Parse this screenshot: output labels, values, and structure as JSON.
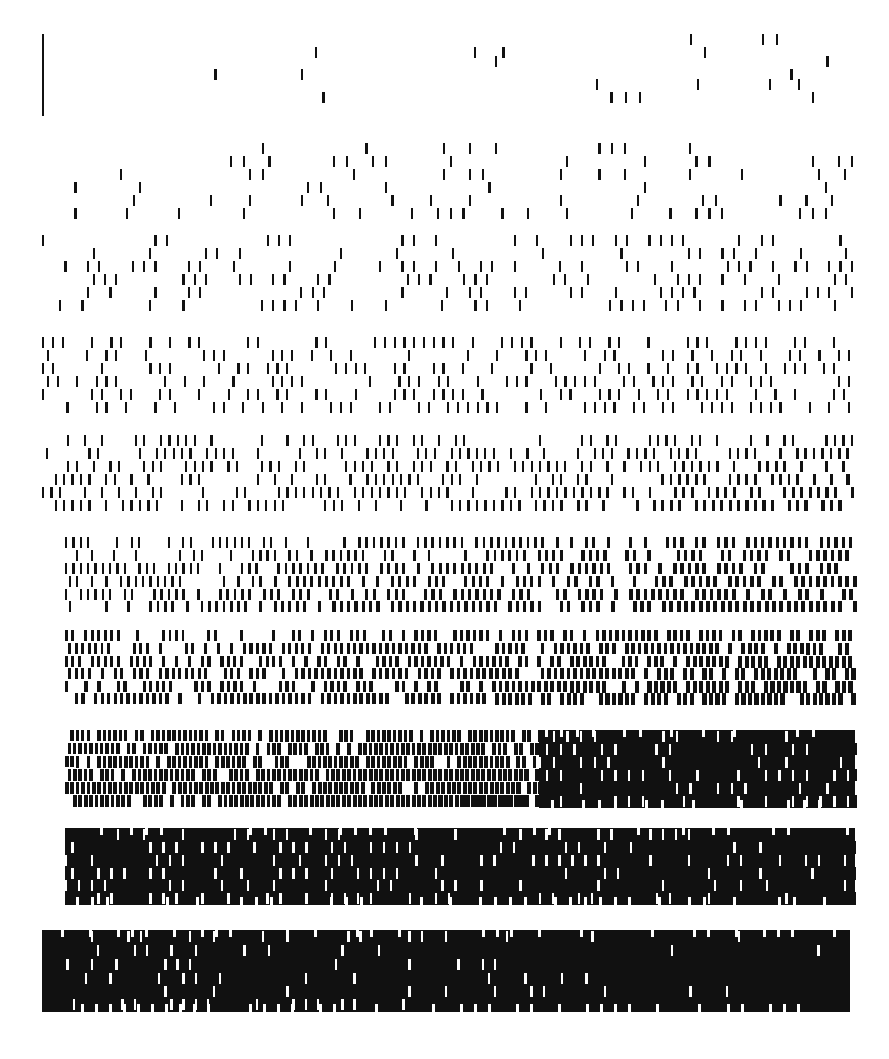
{
  "figure": {
    "type": "raster-pattern",
    "background_color": "#ffffff",
    "ink_color": "#111111",
    "canvas": {
      "width": 889,
      "height": 1059
    },
    "band_count": 10,
    "rows_per_band": 6,
    "dash_width_px": 2.2,
    "dash_height_px": 11,
    "row_pitch_px": 13,
    "marker": {
      "name": "left-rule",
      "x": 42,
      "y_top": 34,
      "y_bottom": 116,
      "width": 2.4,
      "color": "#111111"
    },
    "bands": [
      {
        "index": 1,
        "label": "band-1",
        "y_top": 34,
        "y_bottom": 122,
        "x_start": 200,
        "x_end": 860,
        "density_start": 0.02,
        "density_end": 0.16,
        "rows": 6,
        "row_offsets": [
          0,
          22,
          13,
          45,
          35,
          58
        ],
        "has_rule": true
      },
      {
        "index": 2,
        "label": "band-2",
        "y_top": 143,
        "y_bottom": 222,
        "x_start": 42,
        "x_end": 858,
        "density_start": 0.12,
        "density_end": 0.3,
        "rows": 6,
        "row_offsets": [
          0,
          13,
          26,
          39,
          52,
          65
        ],
        "has_rule": false
      },
      {
        "index": 3,
        "label": "band-3",
        "y_top": 235,
        "y_bottom": 313,
        "x_start": 42,
        "x_end": 858,
        "density_start": 0.26,
        "density_end": 0.44,
        "rows": 6,
        "row_offsets": [
          0,
          13,
          26,
          39,
          52,
          65
        ],
        "has_rule": false
      },
      {
        "index": 4,
        "label": "band-4",
        "y_top": 337,
        "y_bottom": 415,
        "x_start": 42,
        "x_end": 855,
        "density_start": 0.38,
        "density_end": 0.56,
        "rows": 6,
        "row_offsets": [
          0,
          13,
          26,
          39,
          52,
          65
        ],
        "has_rule": false
      },
      {
        "index": 5,
        "label": "band-5",
        "y_top": 435,
        "y_bottom": 513,
        "x_start": 42,
        "x_end": 855,
        "density_start": 0.5,
        "density_end": 0.66,
        "rows": 6,
        "row_offsets": [
          0,
          13,
          26,
          39,
          52,
          65
        ],
        "has_rule": false
      },
      {
        "index": 6,
        "label": "band-6",
        "y_top": 537,
        "y_bottom": 613,
        "x_start": 65,
        "x_end": 855,
        "density_start": 0.6,
        "density_end": 0.74,
        "rows": 6,
        "row_offsets": [
          0,
          13,
          26,
          39,
          52,
          64
        ],
        "has_rule": false
      },
      {
        "index": 7,
        "label": "band-7",
        "y_top": 630,
        "y_bottom": 705,
        "x_start": 65,
        "x_end": 855,
        "density_start": 0.68,
        "density_end": 0.8,
        "rows": 6,
        "row_offsets": [
          0,
          13,
          26,
          38,
          51,
          63
        ],
        "has_rule": false
      },
      {
        "index": 8,
        "label": "band-8",
        "y_top": 730,
        "y_bottom": 808,
        "x_start": 65,
        "x_end": 855,
        "density_start": 0.78,
        "density_end": 0.88,
        "rows": 6,
        "row_offsets": [
          0,
          13,
          26,
          39,
          52,
          65
        ],
        "has_rule": false
      },
      {
        "index": 9,
        "label": "band-9",
        "y_top": 828,
        "y_bottom": 905,
        "x_start": 65,
        "x_end": 855,
        "density_start": 0.85,
        "density_end": 0.93,
        "rows": 6,
        "row_offsets": [
          0,
          13,
          26,
          39,
          51,
          64
        ],
        "has_rule": false
      },
      {
        "index": 10,
        "label": "band-10",
        "y_top": 930,
        "y_bottom": 1012,
        "x_start": 42,
        "x_end": 850,
        "density_start": 0.9,
        "density_end": 0.985,
        "rows": 6,
        "row_offsets": [
          0,
          14,
          28,
          42,
          55,
          68
        ],
        "has_rule": false
      }
    ]
  }
}
